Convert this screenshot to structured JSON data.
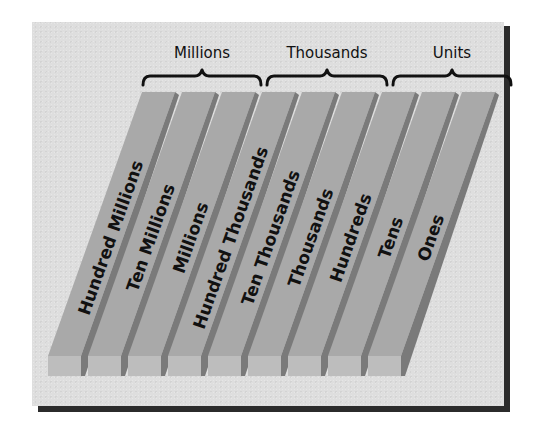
{
  "diagram": {
    "groups": [
      {
        "label": "Millions",
        "bracket_x1": 142,
        "bracket_x2": 262,
        "label_x": 202
      },
      {
        "label": "Thousands",
        "bracket_x1": 266,
        "bracket_x2": 388,
        "label_x": 327
      },
      {
        "label": "Units",
        "bracket_x1": 392,
        "bracket_x2": 512,
        "label_x": 452
      }
    ],
    "bars": [
      {
        "label": "Hundred Millions"
      },
      {
        "label": "Ten Millions"
      },
      {
        "label": "Millions"
      },
      {
        "label": "Hundred Thousands"
      },
      {
        "label": "Ten Thousands"
      },
      {
        "label": "Thousands"
      },
      {
        "label": "Hundreds"
      },
      {
        "label": "Tens"
      },
      {
        "label": "Ones"
      }
    ],
    "colors": {
      "panel_background": "#dedede",
      "panel_shadow": "#2b2b2b",
      "bar_top": "#a9a9a9",
      "bar_side": "#7a7a7a",
      "bar_front": "#bdbdbd",
      "text": "#111111"
    }
  }
}
